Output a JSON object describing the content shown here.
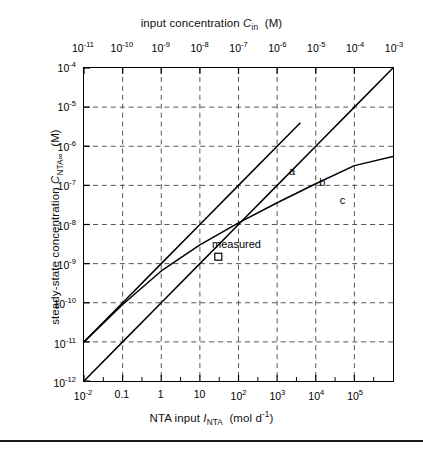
{
  "figure": {
    "top_axis_title_prefix": "input concentration ",
    "top_axis_title_symbol": "C",
    "top_axis_title_sub": "in",
    "top_axis_title_units": "(M)",
    "bottom_axis_title_prefix": "NTA input ",
    "bottom_axis_title_symbol": "I",
    "bottom_axis_title_sub": "NTA",
    "bottom_axis_title_units": "(mol d",
    "bottom_axis_title_units_sup": "-1",
    "bottom_axis_title_units_end": ")",
    "left_axis_title_prefix": "steady-state concentration ",
    "left_axis_title_symbol": "C",
    "left_axis_title_sub": "NTA∞",
    "left_axis_title_units": "(M)",
    "measured_label": "measured"
  },
  "chart_data": {
    "type": "line",
    "title": "",
    "xlabel": "NTA input I_NTA (mol d-1)",
    "ylabel": "steady-state concentration C_NTA-inf (M)",
    "x_scale": "log",
    "y_scale": "log",
    "xlim": [
      0.01,
      1000000
    ],
    "ylim": [
      1e-12,
      0.0001
    ],
    "grid": true,
    "grid_style": "dashed",
    "legend_position": "inline-curve-labels",
    "x_tick_labels": [
      "10-2",
      "0.1",
      "1",
      "10",
      "102",
      "103",
      "104",
      "105"
    ],
    "x_tick_values": [
      0.01,
      0.1,
      1,
      10,
      100,
      1000,
      10000,
      100000
    ],
    "y_tick_labels": [
      "10-4",
      "10-5",
      "10-6",
      "10-7",
      "10-8",
      "10-9",
      "10-10",
      "10-11",
      "10-12"
    ],
    "y_tick_values": [
      0.0001,
      1e-05,
      1e-06,
      1e-07,
      1e-08,
      1e-09,
      1e-10,
      1e-11,
      1e-12
    ],
    "secondary_x_axis": {
      "label": "input concentration C_in (M)",
      "position": "top",
      "tick_labels": [
        "10-11",
        "10-10",
        "10-9",
        "10-8",
        "10-7",
        "10-6",
        "10-5",
        "10-4",
        "10-3"
      ],
      "tick_values": [
        1e-11,
        1e-10,
        1e-09,
        1e-08,
        1e-07,
        1e-06,
        1e-05,
        0.0001,
        0.001
      ]
    },
    "series": [
      {
        "name": "a",
        "label": "a",
        "label_x": 2000,
        "label_y": 3.3e-07,
        "x": [
          0.01,
          0.1,
          1,
          10,
          100,
          1000,
          4000
        ],
        "y": [
          1e-11,
          1e-10,
          1e-09,
          1e-08,
          1e-07,
          1e-06,
          4e-06
        ]
      },
      {
        "name": "b",
        "label": "b",
        "label_x": 12000,
        "label_y": 1.7e-07,
        "x": [
          0.01,
          0.1,
          1,
          10,
          100,
          1000,
          10000,
          100000,
          1000000
        ],
        "y": [
          1e-12,
          1e-11,
          1e-10,
          1e-09,
          1e-08,
          1e-07,
          1e-06,
          1e-05,
          0.0001
        ]
      },
      {
        "name": "c",
        "label": "c",
        "label_x": 40000,
        "label_y": 6e-08,
        "x": [
          0.01,
          0.1,
          1,
          10,
          100,
          1000,
          10000,
          100000,
          1000000
        ],
        "y": [
          1e-11,
          9e-11,
          6.5e-10,
          3e-09,
          1.1e-08,
          3.6e-08,
          1.1e-07,
          3.2e-07,
          5.5e-07
        ]
      }
    ],
    "annotations": [
      {
        "name": "measured",
        "text": "measured",
        "marker": "open-square",
        "x": 30,
        "y": 1.5e-09
      }
    ]
  }
}
